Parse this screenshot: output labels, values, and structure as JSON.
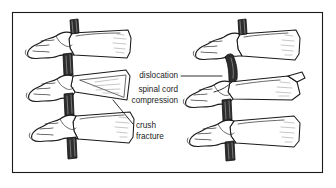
{
  "figure": {
    "kind": "medical-line-illustration",
    "background_color": "#ffffff",
    "ink_color": "#1a1a1a",
    "frame": {
      "name": "illustration-border",
      "x": 12,
      "y": 12,
      "width": 311,
      "height": 161,
      "stroke_color": "#1b1b1b"
    },
    "panels": [
      {
        "id": "left-panel",
        "name": "crush-fracture-panel",
        "description": "three stacked vertebrae in lateral view with a wedge-shaped collapsed vertebral body",
        "vertebra_count": 3
      },
      {
        "id": "right-panel",
        "name": "dislocation-panel",
        "description": "three stacked vertebrae in lateral view with the upper vertebra displaced forward and the spinal cord pinched",
        "vertebra_count": 3
      }
    ],
    "labels": [
      {
        "id": "dislocation",
        "name": "label-dislocation",
        "text": "dislocation",
        "lines": [
          "dislocation"
        ],
        "x": 178,
        "y": 76,
        "align": "end",
        "leader": "horizontal line running right to the displaced vertebra"
      },
      {
        "id": "spinal-cord-compression",
        "name": "label-spinal-cord-compression",
        "text": "spinal cord compression",
        "lines": [
          "spinal cord",
          "compression"
        ],
        "x": 178,
        "y": 93,
        "align": "end",
        "leader": "diagonal line running up-right to the pinched cord"
      },
      {
        "id": "crush-fracture",
        "name": "label-crush-fracture",
        "text": "crush fracture",
        "lines": [
          "crush",
          "fracture"
        ],
        "x": 135,
        "y": 127,
        "align": "start",
        "leader": "diagonal line running up-left to the collapsed vertebral body"
      }
    ],
    "cord_segments": {
      "name": "spinal-cord-segments",
      "fill_color": "#2e2e2e",
      "count": 6,
      "note": "dark shaded cylinders representing the spinal cord between vertebral bodies"
    }
  }
}
